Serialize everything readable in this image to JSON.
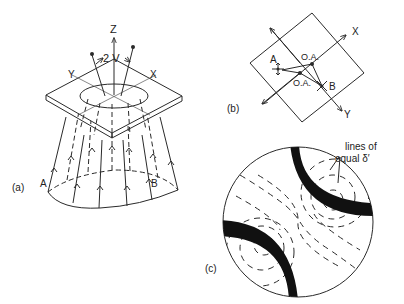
{
  "figure": {
    "panels": [
      {
        "id": "a",
        "label": "(a)",
        "description": "Convergent light cone passing through a crystal plate",
        "axes": {
          "z": "Z",
          "x": "X",
          "y": "Y"
        },
        "angle_label": "2 V",
        "points": {
          "a": "A",
          "b": "B"
        }
      },
      {
        "id": "b",
        "label": "(b)",
        "description": "Plan view of plate showing optic axes",
        "axes": {
          "x": "X",
          "y": "Y"
        },
        "points": {
          "a": "A",
          "b": "B"
        },
        "optic_axis_labels": [
          "O.A.",
          "O.A."
        ]
      },
      {
        "id": "c",
        "label": "(c)",
        "description": "Interference figure with isogyres and isochromes",
        "annotation": "lines of equal δ′",
        "annotation_line1": "lines of",
        "annotation_line2": "equal δ′"
      }
    ]
  }
}
